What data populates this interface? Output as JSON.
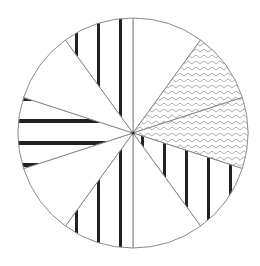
{
  "chart_data": {
    "type": "pie",
    "title": "",
    "legend": [],
    "start_angle_deg": 0,
    "direction": "clockwise",
    "center": [
      133,
      133
    ],
    "radius": 115,
    "colors": {
      "stroke": "#8a8a8a",
      "stripe": "#222222",
      "zigzag": "#9a9a9a",
      "fill": "#ffffff"
    },
    "slices": [
      {
        "label": "",
        "value": 10,
        "pattern": "none"
      },
      {
        "label": "",
        "value": 10,
        "pattern": "zigzag"
      },
      {
        "label": "",
        "value": 10,
        "pattern": "zigzag"
      },
      {
        "label": "",
        "value": 10,
        "pattern": "vertical-stripes"
      },
      {
        "label": "",
        "value": 10,
        "pattern": "none"
      },
      {
        "label": "",
        "value": 10,
        "pattern": "vertical-stripes"
      },
      {
        "label": "",
        "value": 10,
        "pattern": "none"
      },
      {
        "label": "",
        "value": 10,
        "pattern": "horizontal-stripes"
      },
      {
        "label": "",
        "value": 10,
        "pattern": "none"
      },
      {
        "label": "",
        "value": 10,
        "pattern": "vertical-stripes"
      }
    ]
  }
}
